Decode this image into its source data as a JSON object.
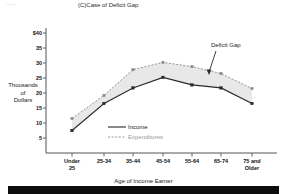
{
  "chart_data": {
    "type": "line",
    "title": "(C)Case of Deficit Gap",
    "xlabel": "Age of Income Earner",
    "ylabel": "Thousands of Dollars",
    "ylabel_lines": [
      "Thousands",
      "of",
      "Dollars"
    ],
    "categories": [
      "Under 25",
      "25-34",
      "35-44",
      "45-54",
      "55-64",
      "65-74",
      "75 and Older"
    ],
    "category_lines": [
      [
        "Under",
        "25"
      ],
      [
        "25-34"
      ],
      [
        "35-44"
      ],
      [
        "45-54"
      ],
      [
        "55-64"
      ],
      [
        "65-74"
      ],
      [
        "75 and",
        "Older"
      ]
    ],
    "series": [
      {
        "name": "Income",
        "values": [
          7.5,
          16.5,
          21.7,
          25.2,
          22.7,
          21.7,
          16.5
        ],
        "style": "solid",
        "color": "#2a2a2a"
      },
      {
        "name": "Expenditures",
        "values": [
          11.5,
          19.2,
          27.8,
          30.2,
          28.8,
          26.5,
          21.5
        ],
        "style": "dashed",
        "color": "#8a8a8a"
      }
    ],
    "ylim": [
      0,
      42
    ],
    "yticks": [
      5,
      10,
      15,
      20,
      25,
      30,
      35,
      40
    ],
    "ytick_labels": [
      "5",
      "10",
      "15",
      "20",
      "25",
      "30",
      "35",
      "$40"
    ],
    "grid": false,
    "fill_between": {
      "label": "Deficit Gap",
      "color": "#e8e8e8"
    },
    "annotations": [
      {
        "text": "Deficit Gap",
        "x_px": 213,
        "y_px": 47
      }
    ],
    "legend": {
      "position": "inside-lower-center",
      "entries": [
        "Income",
        "Expenditures"
      ]
    }
  },
  "colors": {
    "income_line": "#2a2a2a",
    "expenditures_line": "#8a8a8a",
    "gap_fill": "#e9e9e9",
    "axis": "#555555",
    "background": "#ffffff",
    "footer_bar": "#0d0d0d"
  }
}
